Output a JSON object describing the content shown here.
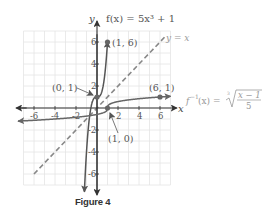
{
  "chart_data": {
    "type": "line",
    "title": "",
    "caption": "Figure 4",
    "xlabel": "x",
    "ylabel": "y",
    "xlim": [
      -7,
      7
    ],
    "ylim": [
      -7,
      7
    ],
    "grid": true,
    "x_ticks": [
      -6,
      -4,
      -2,
      2,
      4,
      6
    ],
    "y_ticks": [
      -6,
      -4,
      -2,
      2,
      4,
      6
    ],
    "x_tick_labels": [
      "-6",
      "-4",
      "-2",
      "2",
      "4",
      "6"
    ],
    "y_tick_labels": [
      "-6",
      "-4",
      "-2",
      "2",
      "4",
      "6"
    ],
    "series": [
      {
        "name": "f",
        "label": "f(x) = 5x³ + 1",
        "equation": "5x^3 + 1",
        "color": "#555555",
        "style": "solid",
        "x_range": [
          -1.2,
          1.0
        ],
        "marked_points": [
          [
            0,
            1
          ],
          [
            1,
            6
          ]
        ]
      },
      {
        "name": "f_inverse",
        "label": "f⁻¹(x) = ∛((x − 1)/5)",
        "equation": "cbrt((x-1)/5)",
        "color": "#666666",
        "style": "solid",
        "x_range": [
          -7.5,
          7.0
        ],
        "marked_points": [
          [
            1,
            0
          ],
          [
            6,
            1
          ]
        ]
      },
      {
        "name": "identity",
        "label": "y = x",
        "equation": "x",
        "color": "#888888",
        "style": "dashed",
        "x_range": [
          -6,
          6.5
        ]
      }
    ],
    "point_labels": [
      {
        "text": "(1, 6)",
        "x": 1,
        "y": 6
      },
      {
        "text": "(0, 1)",
        "x": 0,
        "y": 1
      },
      {
        "text": "(6, 1)",
        "x": 6,
        "y": 1
      },
      {
        "text": "(1, 0)",
        "x": 1,
        "y": 0
      }
    ],
    "legend": "inline-labels"
  }
}
